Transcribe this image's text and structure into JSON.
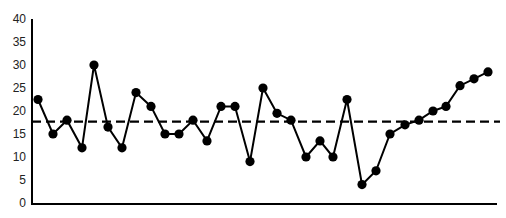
{
  "chart_data": {
    "type": "line",
    "title": "",
    "xlabel": "",
    "ylabel": "",
    "ylim": [
      0,
      40
    ],
    "yticks": [
      0,
      5,
      10,
      15,
      20,
      25,
      30,
      35,
      40
    ],
    "grid": false,
    "legend": null,
    "x": [
      1,
      2,
      3,
      4,
      5,
      6,
      7,
      8,
      9,
      10,
      11,
      12,
      13,
      14,
      15,
      16,
      17,
      18,
      19,
      20,
      21,
      22,
      23,
      24,
      25,
      26,
      27,
      28,
      29,
      30,
      31,
      32,
      33
    ],
    "series": [
      {
        "name": "Observations",
        "values": [
          22.5,
          15,
          18,
          12,
          30,
          16.5,
          12,
          24,
          21,
          15,
          15,
          18,
          13.5,
          21,
          21,
          9,
          25,
          19.5,
          18,
          10,
          13.5,
          10,
          22.5,
          4,
          7,
          15,
          17,
          18,
          20,
          21,
          25.5,
          27,
          28.5
        ],
        "x_px": [
          38,
          53,
          67,
          82,
          94,
          108,
          122,
          136,
          151,
          165,
          179,
          193,
          207,
          221,
          235,
          250,
          263,
          277,
          291,
          306,
          320,
          333,
          347,
          362,
          376,
          390,
          405,
          419,
          433,
          446,
          460,
          474,
          488
        ],
        "marker": "filled-circle",
        "color": "#000000"
      }
    ],
    "reference_lines": [
      {
        "name": "Center line (mean)",
        "value": 17.7,
        "style": "dashed",
        "color": "#000000"
      }
    ]
  },
  "axis": {
    "y_labels": [
      "0",
      "5",
      "10",
      "15",
      "20",
      "25",
      "30",
      "35",
      "40"
    ]
  }
}
